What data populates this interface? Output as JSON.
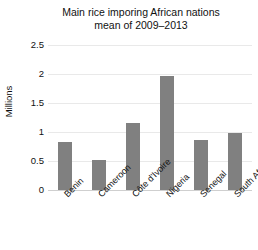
{
  "chart_data": {
    "type": "bar",
    "title": "Main rice imporing African nations mean of 2009–2013",
    "title_lines": [
      "Main rice imporing African nations",
      "mean of 2009–2013"
    ],
    "xlabel": "",
    "ylabel": "Millions",
    "categories": [
      "Benin",
      "Cameroon",
      "Côte d'Ivoire",
      "Nigeria",
      "Senegal",
      "South Africa"
    ],
    "values": [
      0.83,
      0.52,
      1.15,
      1.97,
      0.87,
      0.98
    ],
    "ylim": [
      0,
      2.5
    ],
    "yticks": [
      0,
      0.5,
      1,
      1.5,
      2,
      2.5
    ],
    "ytick_labels": [
      "0",
      "0.5",
      "1",
      "1.5",
      "2",
      "2.5"
    ],
    "grid": true,
    "legend": false,
    "legend_position": "none",
    "bar_color": "#808080",
    "grid_color": "#e9e9e9",
    "axis_color": "#cfcfcf",
    "background": "#ffffff",
    "text_color": "#111111"
  }
}
